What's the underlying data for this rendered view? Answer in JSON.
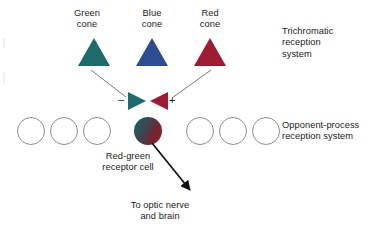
{
  "figure": {
    "type": "diagram",
    "background_color": "#ffffff",
    "text_color": "#1c1c1c"
  },
  "cones": [
    {
      "id": "green-cone",
      "label": "Green\ncone",
      "color": "#1d6b6b",
      "shape": "triangle-up"
    },
    {
      "id": "blue-cone",
      "label": "Blue\ncone",
      "color": "#2e4c93",
      "shape": "triangle-up"
    },
    {
      "id": "red-cone",
      "label": "Red\ncone",
      "color": "#9e1b33",
      "shape": "triangle-up"
    }
  ],
  "synapse": {
    "minus_sign": "–",
    "plus_sign": "+",
    "left_terminal": {
      "id": "green-terminal",
      "color": "#1d6b6b",
      "shape": "triangle-right"
    },
    "right_terminal": {
      "id": "red-terminal",
      "color": "#9e1b33",
      "shape": "triangle-left"
    }
  },
  "receptor_row": {
    "total_circles": 7,
    "filled_index": 3,
    "empty_circle_color": "#8e8e8e",
    "filled_circle_colors": {
      "green": "#1d6b6b",
      "red": "#8e1f2c"
    },
    "caption": "Red-green\nreceptor cell"
  },
  "system_labels": {
    "trichromatic": "Trichromatic\nreception\nsystem",
    "opponent": "Opponent-process\nreception system"
  },
  "output": {
    "caption": "To optic nerve\nand brain",
    "arrow_color": "#111111"
  },
  "connector_lines": {
    "color": "#6a6a6a",
    "from_green_cone_to_minus": true,
    "from_red_cone_to_plus": true
  }
}
